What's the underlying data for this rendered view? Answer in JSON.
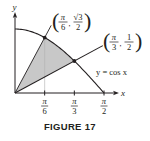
{
  "figure": {
    "caption": "FIGURE 17",
    "curve_label": "y = cos x",
    "axes": {
      "x_label": "x",
      "y_label": "y"
    },
    "ticks": [
      {
        "num": "π",
        "den": "6",
        "value": 0.5236
      },
      {
        "num": "π",
        "den": "3",
        "value": 1.0472
      },
      {
        "num": "π",
        "den": "2",
        "value": 1.5708
      }
    ],
    "points": [
      {
        "name": "upper",
        "x_num": "π",
        "x_den": "6",
        "y_num": "√3",
        "y_den": "2",
        "x": 0.5236,
        "y": 0.866
      },
      {
        "name": "lower",
        "x_num": "π",
        "x_den": "3",
        "y_num": "1",
        "y_den": "2",
        "x": 1.0472,
        "y": 0.5
      }
    ],
    "shaded_region": "triangle-like region between the two lines from origin and the curve y = cos x",
    "colors": {
      "ink": "#231f20",
      "shade": "#c8c8c8",
      "guide": "#b0b0b0"
    }
  }
}
